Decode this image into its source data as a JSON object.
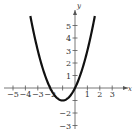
{
  "chart_data": {
    "type": "line",
    "title": "",
    "function": "y = x^2 + 2x",
    "xlabel": "x",
    "ylabel": "y",
    "xlim": [
      -5.5,
      4
    ],
    "ylim": [
      -3.5,
      6
    ],
    "x_ticks": [
      -5,
      -4,
      -3,
      -2,
      -1,
      1,
      2,
      3
    ],
    "y_ticks": [
      -3,
      -2,
      -1,
      1,
      2,
      3,
      4,
      5
    ],
    "x_tick_labels": [
      "−5",
      "−4",
      "−3",
      "−2",
      "1",
      "2",
      "3"
    ],
    "y_tick_labels": [
      "5",
      "4",
      "3",
      "2",
      "1",
      "−2",
      "−3"
    ],
    "grid": false,
    "series": [
      {
        "name": "parabola",
        "color": "#111111",
        "x": [
          -3.6,
          -3,
          -2.5,
          -2,
          -1.5,
          -1,
          -0.5,
          0,
          0.5,
          1,
          1.6
        ],
        "y": [
          5.76,
          3,
          1.25,
          0,
          -0.75,
          -1,
          -0.75,
          0,
          1.25,
          3,
          5.76
        ]
      }
    ],
    "vertex": [
      -1,
      -1
    ],
    "x_intercepts": [
      -2,
      0
    ]
  },
  "labels": {
    "x_axis": "x",
    "y_axis": "y"
  }
}
